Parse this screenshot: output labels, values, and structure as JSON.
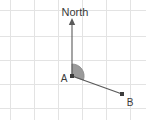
{
  "canvas": {
    "width": 146,
    "height": 120,
    "background": "#ffffff"
  },
  "grid": {
    "line_color": "#e3e3e3",
    "cell_size": 24,
    "x_lines": [
      10,
      34,
      58,
      82,
      106,
      130
    ],
    "y_lines": [
      10,
      36,
      60,
      84,
      108
    ]
  },
  "diagram": {
    "type": "bearing-diagram",
    "stroke_color": "#5a5a5a",
    "wedge_fill": "#9a9a9a",
    "north_label": "North",
    "points": [
      {
        "id": "A",
        "label": "A",
        "x": 72,
        "y": 76,
        "label_x": 64,
        "label_y": 81
      },
      {
        "id": "B",
        "label": "B",
        "x": 122,
        "y": 94,
        "label_x": 128,
        "label_y": 104
      }
    ],
    "north_ray": {
      "x1": 72,
      "y1": 76,
      "x2": 72,
      "y2": 21
    },
    "north_label_pos": {
      "x": 75,
      "y": 15
    },
    "bearing_segment": {
      "x1": 72,
      "y1": 76,
      "x2": 122,
      "y2": 94
    },
    "angle_wedge": {
      "vertex_x": 72,
      "vertex_y": 76,
      "radius": 12,
      "start_x": 72,
      "start_y": 64,
      "end_x": 83.4,
      "end_y": 80.1
    }
  }
}
